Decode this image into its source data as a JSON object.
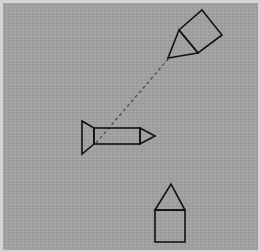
{
  "figure": {
    "colors": {
      "background": "#a2a2a2",
      "border": "#d4d4d4",
      "stroke": "#111111",
      "dashed_line": "#444444"
    },
    "objects": [
      {
        "name": "kite-agent",
        "description": "Square body with triangular head pointing down-left",
        "square": [
          [
            202,
            10
          ],
          [
            222,
            35
          ],
          [
            198,
            53
          ],
          [
            179,
            30
          ]
        ],
        "triangle_apex": [
          168,
          58
        ]
      },
      {
        "name": "rocket-agent",
        "description": "Rectangle body with triangular nose pointing right and trapezoid tail fin",
        "tail": [
          [
            82,
            121
          ],
          [
            94,
            128
          ],
          [
            94,
            144
          ],
          [
            82,
            154
          ]
        ],
        "body": {
          "x": 94,
          "y": 128,
          "w": 46,
          "h": 16
        },
        "nose_tip": [
          155,
          136
        ]
      },
      {
        "name": "house-agent",
        "description": "Square with triangular roof pointing up",
        "apex": [
          171,
          184
        ],
        "body": {
          "x": 155,
          "y": 210,
          "w": 30,
          "h": 32
        }
      }
    ],
    "dashed_line": {
      "from": [
        96,
        143
      ],
      "to": [
        169,
        58
      ]
    }
  }
}
